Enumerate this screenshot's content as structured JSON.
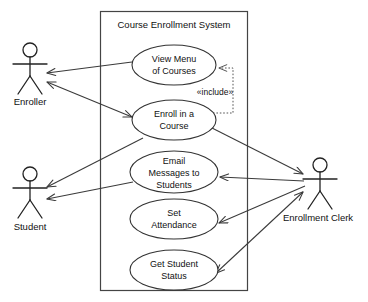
{
  "diagram": {
    "kind": "uml-use-case-diagram",
    "width": 368,
    "height": 302,
    "background_color": "#ffffff",
    "line_color": "#3a3a3a",
    "text_color": "#111111"
  },
  "system_boundary": {
    "title": "Course Enrollment System",
    "x": 100,
    "y": 11,
    "width": 148,
    "height": 280
  },
  "actors": [
    {
      "id": "enroller",
      "label": "Enroller",
      "cx": 30,
      "cy": 50,
      "label_x": 30,
      "label_y": 102
    },
    {
      "id": "student",
      "label": "Student",
      "cx": 30,
      "cy": 174,
      "label_x": 30,
      "label_y": 230
    },
    {
      "id": "enrollment_clerk",
      "label": "Enrollment Clerk",
      "cx": 320,
      "cy": 165,
      "label_x": 318,
      "label_y": 221
    }
  ],
  "use_cases": [
    {
      "id": "view_menu",
      "lines": [
        "View Menu",
        "of Courses"
      ],
      "cx": 174,
      "cy": 65,
      "rx": 42,
      "ry": 20
    },
    {
      "id": "enroll_course",
      "lines": [
        "Enroll in a",
        "Course"
      ],
      "cx": 174,
      "cy": 120,
      "rx": 42,
      "ry": 20
    },
    {
      "id": "email_messages",
      "lines": [
        "Email",
        "Messages to",
        "Students"
      ],
      "cx": 174,
      "cy": 172,
      "rx": 44,
      "ry": 21
    },
    {
      "id": "set_attendance",
      "lines": [
        "Set",
        "Attendance"
      ],
      "cx": 174,
      "cy": 219,
      "rx": 44,
      "ry": 20
    },
    {
      "id": "get_student_status",
      "lines": [
        "Get Student",
        "Status"
      ],
      "cx": 174,
      "cy": 270,
      "rx": 44,
      "ry": 20
    }
  ],
  "relationships": [
    {
      "id": "enroller-view-menu",
      "type": "association",
      "from": "view_menu",
      "to": "enroller",
      "arrow_at": "to"
    },
    {
      "id": "enroller-enroll-course",
      "type": "association",
      "from": "enroller",
      "to": "enroll_course",
      "arrow_at": "both"
    },
    {
      "id": "student-enroll-course",
      "type": "association",
      "from": "enroll_course",
      "to": "student",
      "arrow_at": "to"
    },
    {
      "id": "student-email-messages",
      "type": "association",
      "from": "email_messages",
      "to": "student",
      "arrow_at": "to"
    },
    {
      "id": "clerk-enroll-course",
      "type": "association",
      "from": "enroll_course",
      "to": "enrollment_clerk",
      "arrow_at": "to"
    },
    {
      "id": "clerk-email-messages",
      "type": "association",
      "from": "enrollment_clerk",
      "to": "email_messages",
      "arrow_at": "to"
    },
    {
      "id": "clerk-set-attendance",
      "type": "association",
      "from": "enrollment_clerk",
      "to": "set_attendance",
      "arrow_at": "to"
    },
    {
      "id": "clerk-get-student-status",
      "type": "association",
      "from": "get_student_status",
      "to": "enrollment_clerk",
      "arrow_at": "both"
    },
    {
      "id": "include-enroll-view-menu",
      "type": "include",
      "from": "enroll_course",
      "to": "view_menu",
      "label": "«include»",
      "label_x": 215,
      "label_y": 95,
      "arrow_at": "to"
    }
  ]
}
